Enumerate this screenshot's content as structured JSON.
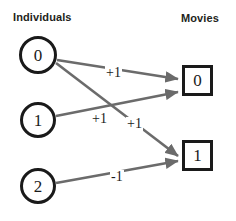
{
  "headings": {
    "left": "Individuals",
    "right": "Movies"
  },
  "colors": {
    "node_stroke": "#1a1a1a",
    "edge": "#6b6b6b",
    "text": "#1a1a1a",
    "background": "#ffffff"
  },
  "individuals": [
    {
      "id": "individual-0",
      "label": "0",
      "cx": 38,
      "cy": 55,
      "r": 19
    },
    {
      "id": "individual-1",
      "label": "1",
      "cx": 38,
      "cy": 120,
      "r": 18
    },
    {
      "id": "individual-2",
      "label": "2",
      "cx": 38,
      "cy": 186,
      "r": 18
    }
  ],
  "movies": [
    {
      "id": "movie-0",
      "label": "0",
      "x": 182,
      "y": 65,
      "w": 31,
      "h": 31
    },
    {
      "id": "movie-1",
      "label": "1",
      "x": 182,
      "y": 140,
      "w": 31,
      "h": 31
    }
  ],
  "edges": [
    {
      "id": "edge-ind0-mov0",
      "from": "individual-0",
      "to": "movie-0",
      "weight": "+1",
      "label_x": 105,
      "label_y": 66,
      "x1": 57,
      "y1": 60,
      "x2": 178,
      "y2": 79
    },
    {
      "id": "edge-ind0-mov1",
      "from": "individual-0",
      "to": "movie-1",
      "weight": "+1",
      "label_x": 126,
      "label_y": 117,
      "x1": 56,
      "y1": 63,
      "x2": 178,
      "y2": 156
    },
    {
      "id": "edge-ind1-mov0",
      "from": "individual-1",
      "to": "movie-0",
      "weight": "+1",
      "label_x": 91,
      "label_y": 112,
      "x1": 56,
      "y1": 116,
      "x2": 178,
      "y2": 92
    },
    {
      "id": "edge-ind2-mov1",
      "from": "individual-2",
      "to": "movie-1",
      "weight": "-1",
      "label_x": 110,
      "label_y": 170,
      "x1": 56,
      "y1": 183,
      "x2": 178,
      "y2": 161
    }
  ],
  "graph_meta": {
    "type": "bipartite-graph",
    "left_node_shape": "circle",
    "right_node_shape": "square",
    "edge_count": 4
  }
}
